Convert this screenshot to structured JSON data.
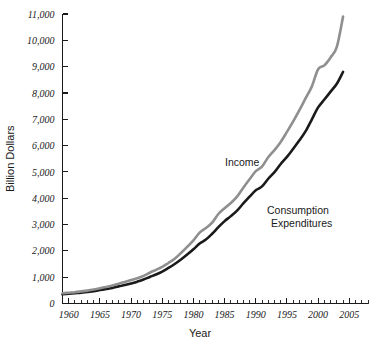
{
  "chart_data": {
    "type": "line",
    "title": "",
    "xlabel": "Year",
    "ylabel": "Billion Dollars",
    "xlim": [
      1959,
      2008
    ],
    "ylim": [
      0,
      11000
    ],
    "grid": false,
    "legend_position": "inline-annotation",
    "y_ticks": [
      0,
      1000,
      2000,
      3000,
      4000,
      5000,
      6000,
      7000,
      8000,
      9000,
      10000,
      11000
    ],
    "y_tick_labels": [
      "0",
      "1,000",
      "2,000",
      "3,000",
      "4,000",
      "5,000",
      "6,000",
      "7,000",
      "8,000",
      "9,000",
      "10,000",
      "11,000"
    ],
    "x_ticks": [
      1960,
      1965,
      1970,
      1975,
      1980,
      1985,
      1990,
      1995,
      2000,
      2005
    ],
    "x_tick_labels": [
      "1960",
      "1965",
      "1970",
      "1975",
      "1980",
      "1985",
      "1990",
      "1995",
      "2000",
      "2005"
    ],
    "x_minor_tick_interval": 1,
    "x": [
      1959,
      1960,
      1961,
      1962,
      1963,
      1964,
      1965,
      1966,
      1967,
      1968,
      1969,
      1970,
      1971,
      1972,
      1973,
      1974,
      1975,
      1976,
      1977,
      1978,
      1979,
      1980,
      1981,
      1982,
      1983,
      1984,
      1985,
      1986,
      1987,
      1988,
      1989,
      1990,
      1991,
      1992,
      1993,
      1994,
      1995,
      1996,
      1997,
      1998,
      1999,
      2000,
      2001,
      2002,
      2003,
      2004
    ],
    "series": [
      {
        "name": "Income",
        "color": "#8f8f8f",
        "annotation": "Income",
        "values": [
          390,
          410,
          430,
          460,
          490,
          530,
          580,
          630,
          680,
          750,
          820,
          890,
          960,
          1050,
          1170,
          1280,
          1390,
          1540,
          1700,
          1920,
          2150,
          2400,
          2690,
          2870,
          3070,
          3400,
          3620,
          3820,
          4060,
          4400,
          4720,
          5030,
          5200,
          5560,
          5830,
          6140,
          6520,
          6920,
          7350,
          7800,
          8250,
          8900,
          9050,
          9350,
          9750,
          10900
        ]
      },
      {
        "name": "Consumption Expenditures",
        "color": "#1a1a1a",
        "annotation": "Consumption Expenditures",
        "annotation_lines": [
          "Consumption",
          "Expenditures"
        ],
        "values": [
          350,
          370,
          390,
          410,
          440,
          470,
          510,
          550,
          590,
          650,
          700,
          760,
          830,
          910,
          1010,
          1100,
          1210,
          1350,
          1500,
          1670,
          1860,
          2060,
          2280,
          2430,
          2650,
          2900,
          3130,
          3320,
          3530,
          3800,
          4060,
          4300,
          4450,
          4740,
          4990,
          5300,
          5570,
          5880,
          6200,
          6550,
          7000,
          7450,
          7750,
          8050,
          8350,
          8800
        ]
      }
    ]
  },
  "annotations": {
    "income_label": "Income",
    "consumption_label_line1": "Consumption",
    "consumption_label_line2": "Expenditures"
  }
}
